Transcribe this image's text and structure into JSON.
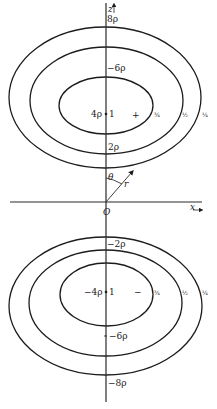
{
  "axes": {
    "z_label": "z",
    "x_label": "x",
    "origin_label": "O",
    "theta_label": "θ",
    "r_label": "r"
  },
  "upper": {
    "tick_8": "8ρ",
    "tick_6": "−6ρ",
    "tick_4": "4ρ",
    "tick_2": "2ρ",
    "center_value": "1",
    "sign": "+",
    "contour_labels": [
      "¾",
      "½",
      "¼"
    ]
  },
  "lower": {
    "tick_m2": "−2ρ",
    "tick_m4": "−4ρ",
    "tick_m6": "−6ρ",
    "tick_m8": "−8ρ",
    "center_value": "1",
    "sign": "−",
    "contour_labels": [
      "¾",
      "½",
      "¼"
    ]
  },
  "colors": {
    "line": "#1c1c1c",
    "background": "#ffffff"
  }
}
